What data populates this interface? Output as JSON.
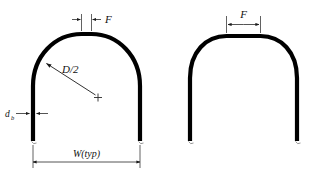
{
  "figure": {
    "background_color": "#ffffff",
    "line_color": "#000000",
    "dimension_color": "#2a2a2a",
    "width_px": 325,
    "height_px": 178
  },
  "labels": {
    "f_left": "F",
    "f_right": "F",
    "radius": "D/2",
    "bar_diameter": "d",
    "bar_diameter_sub": "b",
    "width": "W(typ)"
  },
  "left_figure": {
    "name": "semicircular-arch",
    "leg_left_x": 33,
    "leg_right_x": 140,
    "leg_bottom_y": 141,
    "top_y": 32,
    "bar_thickness": 4,
    "flat_top_half_width": 5,
    "center_x": 86.5,
    "radius_center": {
      "x": 98,
      "y": 97
    },
    "radius_arrow_tip": {
      "x": 45,
      "y": 62
    },
    "f_dimension_span": 9,
    "f_dimension_y": 19,
    "db_dimension_y": 113,
    "w_dimension_y": 162
  },
  "right_figure": {
    "name": "flat-top-arch",
    "leg_left_x": 190,
    "leg_right_x": 297,
    "leg_bottom_y": 141,
    "top_y": 34,
    "bar_thickness": 4,
    "flat_top_half_width": 17,
    "center_x": 243.5,
    "f_dimension_span": 34,
    "f_dimension_y": 24
  }
}
